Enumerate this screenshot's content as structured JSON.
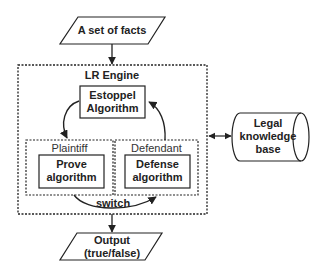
{
  "diagram": {
    "input": {
      "label": "A set of facts"
    },
    "engine": {
      "label": "LR Engine",
      "estoppel": {
        "line1": "Estoppel",
        "line2": "Algorithm"
      },
      "plaintiff": {
        "label": "Plaintiff",
        "algorithm": {
          "line1": "Prove",
          "line2": "algorithm"
        }
      },
      "defendant": {
        "label": "Defendant",
        "algorithm": {
          "line1": "Defense",
          "line2": "algorithm"
        }
      },
      "switch_label": "switch"
    },
    "knowledge_base": {
      "line1": "Legal",
      "line2": "knowledge",
      "line3": "base"
    },
    "output": {
      "line1": "Output",
      "line2": "(true/false)"
    },
    "colors": {
      "stroke": "#222222",
      "background": "#ffffff"
    }
  }
}
